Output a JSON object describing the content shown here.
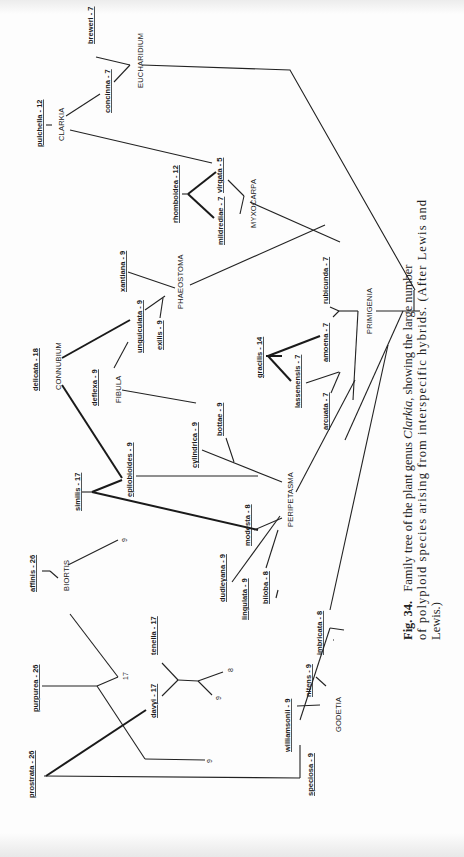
{
  "figure": {
    "type": "phylogenetic family tree (rotated page)",
    "caption": {
      "label": "Fig. 34.",
      "line1": "Family tree of the plant genus Clarkia, showing the large number",
      "line1_a": "Family tree of the plant genus ",
      "line1_italic": "Clarkia",
      "line1_b": ", showing the large number",
      "line2": "of polyploid species arising from interspecific hybrids. (After Lewis and",
      "line3": "Lewis.)"
    },
    "sections": {
      "eucharidium": "EUCHARIDIUM",
      "clarkia": "CLARKIA",
      "myxocarpa": "MYXOCARPA",
      "phaeostoma": "PHAEOSTOMA",
      "connubium": "CONNUBIUM",
      "fibula": "FIBULA",
      "primigenia": "PRIMIGENIA",
      "peripetasma": "PERIPETASMA",
      "biortis": "BIORTIS",
      "godetia": "GODETIA"
    },
    "species": {
      "breweri": "breweri - 7",
      "concinna": "concinna - 7",
      "pulchella": "pulchella - 12",
      "rhomboidea": "rhomboidea - 12",
      "virgata": "virgata - 5",
      "mildrediae": "mildrediae - 7",
      "xantiana": "xantiana - 9",
      "unguiculata": "unguiculata - 9",
      "exilis": "exilis - 9",
      "delicata": "delicata - 18",
      "deflexa": "deflexa - 9",
      "gracilis": "gracilis - 14",
      "lassenensis": "lassenensis - 7",
      "amoena": "amoena - 7",
      "rubicunda": "rubicunda - 7",
      "arcuata": "arcuata - 7",
      "cylindrica": "cylindrica - 9",
      "bottae": "bottae - 9",
      "similis": "similis - 17",
      "epilobioides": "epilobioides - 9",
      "modesta": "modesta - 8",
      "dudleyana": "dudleyana - 9",
      "lingulata": "lingulata - 9",
      "biloba": "biloba - 8",
      "affinis": "affinis - 26",
      "purpurea": "purpurea - 26",
      "tenella": "tenella - 17",
      "davyi": "davyi - 17",
      "prostrata": "prostrata - 26",
      "williamsonii": "williamsonii - 9",
      "nitens": "nitens - 9",
      "imbricata": "imbricata - 8",
      "speciosa": "speciosa - 9"
    },
    "chromosome_numbers": {
      "biortis_tip": "9",
      "purpurea_node": "17",
      "purpurea_tip": "9",
      "tenella_tip_a": "8",
      "tenella_tip_b": "9"
    },
    "colors": {
      "ink": "#1b1b1b",
      "paper": "#fdfdfd"
    }
  }
}
